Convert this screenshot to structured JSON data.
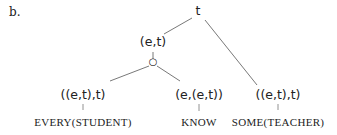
{
  "example_label": "b.",
  "tree": {
    "root": {
      "type": "t"
    },
    "vp": {
      "type": "(e,t)"
    },
    "composition_operator": "○",
    "subject": {
      "type": "((e,t),t)",
      "word": "EVERY(STUDENT)"
    },
    "verb": {
      "type": "(e,(e,t))",
      "word": "KNOW"
    },
    "object": {
      "type": "((e,t),t)",
      "word": "SOME(TEACHER)"
    }
  },
  "colors": {
    "line": "#555555",
    "text": "#222222"
  }
}
